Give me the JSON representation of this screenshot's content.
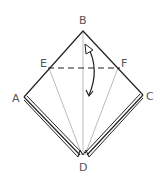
{
  "diagram": {
    "type": "origami-fold-step",
    "labels": {
      "B": "B",
      "E": "E",
      "F": "F",
      "A": "A",
      "C": "C",
      "D": "D"
    },
    "colors": {
      "outline": "#222222",
      "crease": "#aaaaaa",
      "label": "#555555",
      "background": "#ffffff"
    },
    "fold_line": "valley fold E–F (dashed)",
    "arrow": "curved fold arrow from B down past E–F"
  }
}
